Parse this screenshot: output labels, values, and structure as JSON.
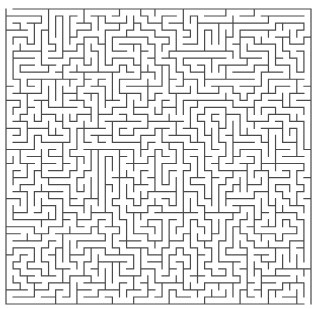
{
  "puzzle": {
    "type": "maze",
    "title": "Maze",
    "cols": 43,
    "rows": 42,
    "origin_x": 6,
    "origin_y": 9,
    "width": 305,
    "height": 295,
    "wall_color": "#4a4a4a",
    "wall_width": 1.2,
    "background": "#ffffff",
    "entrance": {
      "side": "top",
      "col": 0
    },
    "exit": {
      "side": "bottom",
      "col": 42
    },
    "seed": 20240611
  }
}
